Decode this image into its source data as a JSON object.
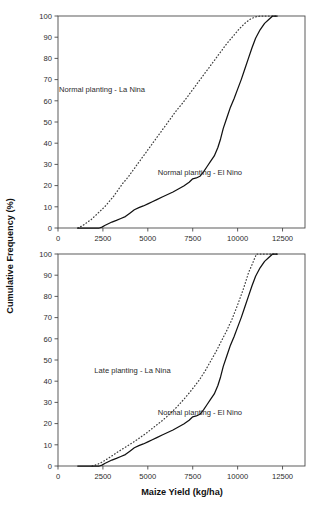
{
  "figure": {
    "xlabel": "Maize Yield (kg/ha)",
    "ylabel": "Cumulative Frequency (%)",
    "background_color": "#ffffff",
    "line_color": "#111111"
  },
  "chart_data": [
    {
      "type": "line",
      "panel": "top",
      "title": "",
      "xlabel": "",
      "ylabel": "Cumulative Frequency (%)",
      "xlim": [
        0,
        13750
      ],
      "ylim": [
        0,
        100
      ],
      "xticks": [
        0,
        2500,
        5000,
        7500,
        10000,
        12500
      ],
      "xticklabels": [
        "0",
        "2500",
        "5000",
        "7500",
        "10000",
        "12500"
      ],
      "yticks": [
        0,
        10,
        20,
        30,
        40,
        50,
        60,
        70,
        80,
        90,
        100
      ],
      "yticklabels": [
        "0",
        "10",
        "20",
        "30",
        "40",
        "50",
        "60",
        "70",
        "80",
        "90",
        "100"
      ],
      "grid": false,
      "legend": "inline-annotations",
      "series": [
        {
          "name": "Normal planting - La Nina",
          "style": "dotted",
          "annotation": "Normal planting - La Nina",
          "annotation_xy": [
            2450,
            64
          ],
          "x": [
            1100,
            1350,
            1600,
            1850,
            2100,
            2350,
            2600,
            2850,
            3100,
            3350,
            3600,
            3900,
            4200,
            4500,
            4800,
            5100,
            5400,
            5700,
            6000,
            6300,
            6600,
            6950,
            7300,
            7650,
            8000,
            8350,
            8700,
            9050,
            9400,
            9750,
            10100,
            10400,
            10700,
            11000,
            11300,
            12200
          ],
          "y": [
            0,
            1,
            2.5,
            4,
            6,
            8,
            10,
            12.5,
            15,
            18,
            21,
            24,
            27.5,
            31,
            34.5,
            38,
            41.5,
            45,
            48.5,
            52,
            55.5,
            59,
            63,
            67,
            71,
            75,
            79,
            83,
            87,
            90.5,
            94,
            96.5,
            98.5,
            99.6,
            100,
            100
          ]
        },
        {
          "name": "Normal planting - El Nino",
          "style": "solid",
          "annotation": "Normal planting - El Nino",
          "annotation_xy": [
            7900,
            25
          ],
          "x": [
            1100,
            1500,
            1900,
            2300,
            2450,
            2600,
            2800,
            3000,
            3250,
            3500,
            3750,
            4000,
            4250,
            4500,
            4750,
            5000,
            5250,
            5500,
            5800,
            6100,
            6400,
            6700,
            7000,
            7300,
            7500,
            7700,
            7900,
            8100,
            8300,
            8500,
            8700,
            8900,
            9050,
            9200,
            9400,
            9600,
            9800,
            10000,
            10200,
            10400,
            10600,
            10800,
            11000,
            11250,
            11500,
            11750,
            11950,
            12200
          ],
          "y": [
            0,
            0,
            0,
            0,
            0.4,
            1.2,
            2,
            2.8,
            3.6,
            4.5,
            5.4,
            7,
            8.6,
            9.6,
            10.4,
            11.4,
            12.4,
            13.4,
            14.6,
            15.8,
            17,
            18.4,
            19.8,
            21.6,
            23.2,
            23.6,
            24.4,
            26.5,
            29,
            31.5,
            34,
            38,
            42,
            47,
            52,
            57,
            61,
            65.5,
            70,
            75,
            80,
            85,
            89.5,
            93.5,
            96.5,
            98.5,
            100,
            100
          ]
        }
      ]
    },
    {
      "type": "line",
      "panel": "bottom",
      "title": "",
      "xlabel": "Maize Yield (kg/ha)",
      "ylabel": "Cumulative Frequency (%)",
      "xlim": [
        0,
        13750
      ],
      "ylim": [
        0,
        100
      ],
      "xticks": [
        0,
        2500,
        5000,
        7500,
        10000,
        12500
      ],
      "xticklabels": [
        "0",
        "2500",
        "5000",
        "7500",
        "10000",
        "12500"
      ],
      "yticks": [
        0,
        10,
        20,
        30,
        40,
        50,
        60,
        70,
        80,
        90,
        100
      ],
      "yticklabels": [
        "0",
        "10",
        "20",
        "30",
        "40",
        "50",
        "60",
        "70",
        "80",
        "90",
        "100"
      ],
      "grid": false,
      "legend": "inline-annotations",
      "series": [
        {
          "name": "Late planting - La Nina",
          "style": "dotted",
          "annotation": "Late planting - La Nina",
          "annotation_xy": [
            4150,
            44
          ],
          "x": [
            1900,
            2150,
            2400,
            2650,
            2900,
            3150,
            3400,
            3700,
            4000,
            4300,
            4600,
            4900,
            5200,
            5500,
            5800,
            6100,
            6400,
            6700,
            7000,
            7300,
            7600,
            7900,
            8200,
            8500,
            8800,
            9100,
            9400,
            9700,
            10000,
            10300,
            10600,
            10850,
            11050,
            12200
          ],
          "y": [
            0,
            0.6,
            1.6,
            2.8,
            4.2,
            5.6,
            7,
            8.6,
            10.2,
            11.8,
            13.6,
            15.4,
            17.4,
            19.4,
            21.4,
            23.6,
            26,
            28.6,
            31.4,
            34.4,
            37.6,
            41,
            45,
            49.5,
            54,
            59,
            64,
            69.5,
            76,
            83,
            91,
            96,
            100,
            100
          ]
        },
        {
          "name": "Normal planting - El Nino",
          "style": "solid",
          "annotation": "Normal planting - El Nino",
          "annotation_xy": [
            7900,
            24
          ],
          "x": [
            1100,
            1500,
            1900,
            2300,
            2450,
            2600,
            2800,
            3000,
            3250,
            3500,
            3750,
            4000,
            4250,
            4500,
            4750,
            5000,
            5250,
            5500,
            5800,
            6100,
            6400,
            6700,
            7000,
            7300,
            7500,
            7700,
            7900,
            8100,
            8300,
            8500,
            8700,
            8900,
            9050,
            9200,
            9400,
            9600,
            9800,
            10000,
            10200,
            10400,
            10600,
            10800,
            11000,
            11250,
            11500,
            11750,
            11950,
            12200
          ],
          "y": [
            0,
            0,
            0,
            0,
            0.4,
            1.2,
            2,
            2.8,
            3.6,
            4.5,
            5.4,
            7,
            8.6,
            9.6,
            10.4,
            11.4,
            12.4,
            13.4,
            14.6,
            15.8,
            17,
            18.4,
            19.8,
            21.6,
            23.2,
            23.6,
            24.4,
            26.5,
            29,
            31.5,
            34,
            38,
            42,
            47,
            52,
            57,
            61,
            65.5,
            70,
            75,
            80,
            85,
            89.5,
            93.5,
            96.5,
            98.5,
            100,
            100
          ]
        }
      ]
    }
  ]
}
